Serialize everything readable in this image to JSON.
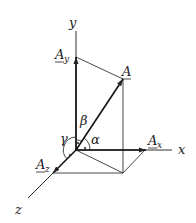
{
  "diagram": {
    "type": "3d-vector-decomposition",
    "axes": {
      "x": "x",
      "y": "y",
      "z": "z"
    },
    "vector": {
      "main": "A",
      "components": [
        {
          "base": "A",
          "sub": "x"
        },
        {
          "base": "A",
          "sub": "y"
        },
        {
          "base": "A",
          "sub": "z"
        }
      ]
    },
    "angles": [
      "α",
      "β",
      "γ"
    ],
    "colors": {
      "line": "#333333",
      "background": "#ffffff"
    }
  }
}
